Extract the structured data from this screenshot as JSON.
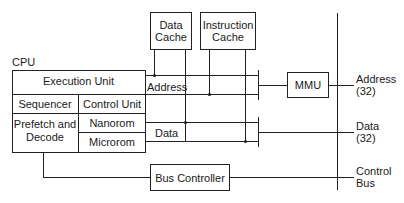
{
  "diagram": {
    "cpu_label": "CPU",
    "cpu_blocks": {
      "execution_unit": "Execution Unit",
      "sequencer": "Sequencer",
      "control_unit": "Control Unit",
      "prefetch_decode_line1": "Prefetch and",
      "prefetch_decode_line2": "Decode",
      "nanorom": "Nanorom",
      "microrom": "Microrom"
    },
    "data_cache": {
      "line1": "Data",
      "line2": "Cache"
    },
    "instruction_cache": {
      "line1": "Instruction",
      "line2": "Cache"
    },
    "mmu": "MMU",
    "bus_controller": "Bus Controller",
    "internal_labels": {
      "address": "Address",
      "data": "Data"
    },
    "external_buses": {
      "address": {
        "line1": "Address",
        "line2": "(32)"
      },
      "data": {
        "line1": "Data",
        "line2": "(32)"
      },
      "control": {
        "line1": "Control",
        "line2": "Bus"
      }
    }
  }
}
